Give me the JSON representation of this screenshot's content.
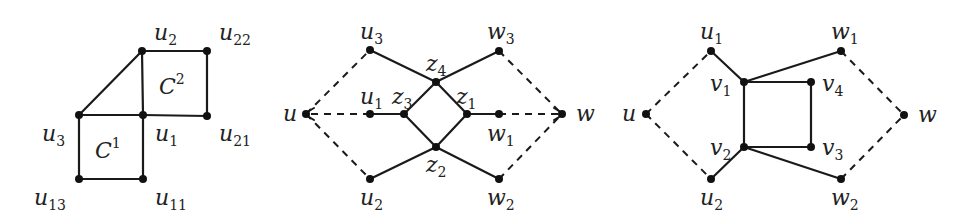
{
  "figures": [
    {
      "id": "fig-a",
      "nodes": [
        {
          "id": "u2",
          "x": 142,
          "y": 51,
          "label": "u",
          "sub": "2",
          "lx": 154,
          "ly": 40
        },
        {
          "id": "u22",
          "x": 207,
          "y": 51,
          "label": "u",
          "sub": "22",
          "lx": 219,
          "ly": 40
        },
        {
          "id": "u3",
          "x": 79,
          "y": 115,
          "label": "u",
          "sub": "3",
          "lx": 42,
          "ly": 141
        },
        {
          "id": "u1",
          "x": 143,
          "y": 115,
          "label": "u",
          "sub": "1",
          "lx": 155,
          "ly": 141
        },
        {
          "id": "u21",
          "x": 207,
          "y": 116,
          "label": "u",
          "sub": "21",
          "lx": 219,
          "ly": 141
        },
        {
          "id": "u13",
          "x": 79,
          "y": 179,
          "label": "u",
          "sub": "13",
          "lx": 34,
          "ly": 205
        },
        {
          "id": "u11",
          "x": 143,
          "y": 179,
          "label": "u",
          "sub": "11",
          "lx": 155,
          "ly": 205
        }
      ],
      "edges": [
        {
          "from": "u2",
          "to": "u22",
          "style": "solid"
        },
        {
          "from": "u22",
          "to": "u21",
          "style": "solid"
        },
        {
          "from": "u21",
          "to": "u1",
          "style": "solid"
        },
        {
          "from": "u1",
          "to": "u2",
          "style": "solid"
        },
        {
          "from": "u2",
          "to": "u3",
          "style": "solid"
        },
        {
          "from": "u3",
          "to": "u1",
          "style": "solid"
        },
        {
          "from": "u3",
          "to": "u13",
          "style": "solid"
        },
        {
          "from": "u13",
          "to": "u11",
          "style": "solid"
        },
        {
          "from": "u11",
          "to": "u1",
          "style": "solid"
        }
      ],
      "regions": [
        {
          "label": "C",
          "sup": "2",
          "x": 159,
          "y": 94
        },
        {
          "label": "C",
          "sup": "1",
          "x": 95,
          "y": 158
        }
      ]
    },
    {
      "id": "fig-b",
      "nodes": [
        {
          "id": "u",
          "x": 306,
          "y": 114,
          "label": "u",
          "sub": "",
          "lx": 283,
          "ly": 121
        },
        {
          "id": "u3",
          "x": 370,
          "y": 50,
          "label": "u",
          "sub": "3",
          "lx": 360,
          "ly": 39
        },
        {
          "id": "u1",
          "x": 370,
          "y": 114,
          "label": "u",
          "sub": "1",
          "lx": 360,
          "ly": 104
        },
        {
          "id": "z3",
          "x": 404,
          "y": 114,
          "label": "z",
          "sub": "3",
          "lx": 392,
          "ly": 104
        },
        {
          "id": "z4",
          "x": 436,
          "y": 82,
          "label": "z",
          "sub": "4",
          "lx": 426,
          "ly": 71
        },
        {
          "id": "z1",
          "x": 467,
          "y": 114,
          "label": "z",
          "sub": "1",
          "lx": 456,
          "ly": 104
        },
        {
          "id": "z2",
          "x": 436,
          "y": 147,
          "label": "z",
          "sub": "2",
          "lx": 426,
          "ly": 172
        },
        {
          "id": "u2",
          "x": 370,
          "y": 179,
          "label": "u",
          "sub": "2",
          "lx": 360,
          "ly": 205
        },
        {
          "id": "w3",
          "x": 499,
          "y": 51,
          "label": "w",
          "sub": "3",
          "lx": 487,
          "ly": 39
        },
        {
          "id": "w1",
          "x": 499,
          "y": 114,
          "label": "w",
          "sub": "1",
          "lx": 487,
          "ly": 141
        },
        {
          "id": "w2",
          "x": 499,
          "y": 179,
          "label": "w",
          "sub": "2",
          "lx": 487,
          "ly": 205
        },
        {
          "id": "w",
          "x": 562,
          "y": 114,
          "label": "w",
          "sub": "",
          "lx": 576,
          "ly": 121
        }
      ],
      "edges": [
        {
          "from": "u3",
          "to": "z4",
          "style": "solid"
        },
        {
          "from": "z4",
          "to": "w3",
          "style": "solid"
        },
        {
          "from": "z4",
          "to": "z3",
          "style": "solid"
        },
        {
          "from": "z4",
          "to": "z1",
          "style": "solid"
        },
        {
          "from": "u1",
          "to": "z3",
          "style": "solid"
        },
        {
          "from": "z3",
          "to": "z2",
          "style": "solid"
        },
        {
          "from": "z1",
          "to": "z2",
          "style": "solid"
        },
        {
          "from": "z1",
          "to": "w1",
          "style": "solid"
        },
        {
          "from": "u2",
          "to": "z2",
          "style": "solid"
        },
        {
          "from": "z2",
          "to": "w2",
          "style": "solid"
        },
        {
          "from": "u",
          "to": "u3",
          "style": "dashed"
        },
        {
          "from": "u",
          "to": "u2",
          "style": "dashed"
        },
        {
          "from": "u1",
          "to": "u",
          "style": "dashed",
          "arrow": true
        },
        {
          "from": "w3",
          "to": "w",
          "style": "dashed"
        },
        {
          "from": "w2",
          "to": "w",
          "style": "dashed"
        },
        {
          "from": "w1",
          "to": "w",
          "style": "dashed",
          "arrow": true
        }
      ],
      "regions": []
    },
    {
      "id": "fig-c",
      "nodes": [
        {
          "id": "u",
          "x": 646,
          "y": 114,
          "label": "u",
          "sub": "",
          "lx": 622,
          "ly": 121
        },
        {
          "id": "u1",
          "x": 711,
          "y": 51,
          "label": "u",
          "sub": "1",
          "lx": 700,
          "ly": 39
        },
        {
          "id": "v1",
          "x": 744,
          "y": 82,
          "label": "v",
          "sub": "1",
          "lx": 710,
          "ly": 91
        },
        {
          "id": "v2",
          "x": 744,
          "y": 147,
          "label": "v",
          "sub": "2",
          "lx": 710,
          "ly": 155
        },
        {
          "id": "u2",
          "x": 711,
          "y": 179,
          "label": "u",
          "sub": "2",
          "lx": 700,
          "ly": 205
        },
        {
          "id": "v4",
          "x": 811,
          "y": 82,
          "label": "v",
          "sub": "4",
          "lx": 822,
          "ly": 91
        },
        {
          "id": "v3",
          "x": 811,
          "y": 147,
          "label": "v",
          "sub": "3",
          "lx": 822,
          "ly": 155
        },
        {
          "id": "w1",
          "x": 841,
          "y": 51,
          "label": "w",
          "sub": "1",
          "lx": 831,
          "ly": 39
        },
        {
          "id": "w2",
          "x": 841,
          "y": 179,
          "label": "w",
          "sub": "2",
          "lx": 831,
          "ly": 205
        },
        {
          "id": "w",
          "x": 904,
          "y": 115,
          "label": "w",
          "sub": "",
          "lx": 918,
          "ly": 122
        }
      ],
      "edges": [
        {
          "from": "u1",
          "to": "v1",
          "style": "solid"
        },
        {
          "from": "v1",
          "to": "w1",
          "style": "solid"
        },
        {
          "from": "v1",
          "to": "v4",
          "style": "solid"
        },
        {
          "from": "v4",
          "to": "v3",
          "style": "solid"
        },
        {
          "from": "v3",
          "to": "v2",
          "style": "solid"
        },
        {
          "from": "v2",
          "to": "v1",
          "style": "solid"
        },
        {
          "from": "v2",
          "to": "u2",
          "style": "solid"
        },
        {
          "from": "v2",
          "to": "w2",
          "style": "solid"
        },
        {
          "from": "u",
          "to": "u1",
          "style": "dashed"
        },
        {
          "from": "u",
          "to": "u2",
          "style": "dashed"
        },
        {
          "from": "w1",
          "to": "w",
          "style": "dashed"
        },
        {
          "from": "w2",
          "to": "w",
          "style": "dashed"
        }
      ],
      "regions": []
    }
  ],
  "colors": {
    "ink": "#1a1a1a",
    "background": "#ffffff"
  }
}
